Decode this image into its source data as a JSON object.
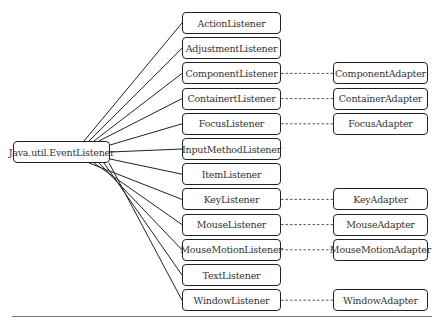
{
  "diagram": {
    "root": {
      "label": "Java.util.EventListener"
    },
    "listeners": [
      {
        "label": "ActionListener",
        "adapter": null
      },
      {
        "label": "AdjustmentListener",
        "adapter": null
      },
      {
        "label": "ComponentListener",
        "adapter": "ComponentAdapter"
      },
      {
        "label": "ContainertListener",
        "adapter": "ContainerAdapter"
      },
      {
        "label": "FocusListener",
        "adapter": "FocusAdapter"
      },
      {
        "label": "InputMethodListener",
        "adapter": null
      },
      {
        "label": "ItemListener",
        "adapter": null
      },
      {
        "label": "KeyListener",
        "adapter": "KeyAdapter"
      },
      {
        "label": "MouseListener",
        "adapter": "MouseAdapter"
      },
      {
        "label": "MouseMotionListener",
        "adapter": "MouseMotionAdapter"
      },
      {
        "label": "TextListener",
        "adapter": null
      },
      {
        "label": "WindowListener",
        "adapter": "WindowAdapter"
      }
    ],
    "colors": {
      "stroke": "#222222",
      "text": "#333333",
      "rule": "#777777"
    }
  }
}
